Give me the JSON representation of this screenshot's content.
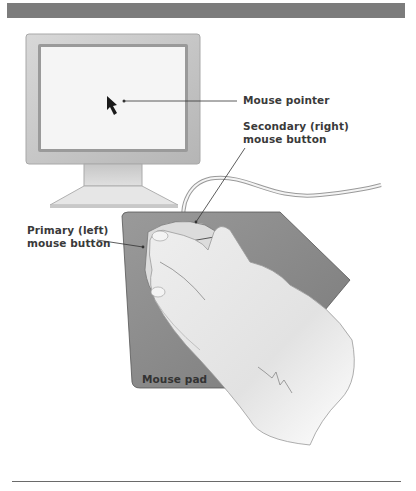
{
  "figure": {
    "labels": {
      "mouse_pointer": "Mouse pointer",
      "secondary_line1": "Secondary (right)",
      "secondary_line2": "mouse button",
      "primary_line1": "Primary (left)",
      "primary_line2": "mouse button",
      "mouse_pad": "Mouse pad"
    },
    "colors": {
      "header_bar": "#7c7c7c",
      "monitor_frame": "#c9c9c9",
      "screen": "#f6f6f6",
      "mouse_pad": "#8e8e8e",
      "label_text": "#3a3a3a"
    }
  }
}
